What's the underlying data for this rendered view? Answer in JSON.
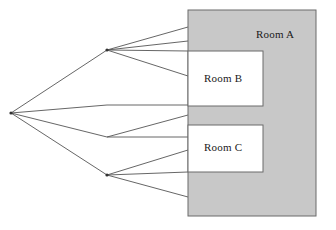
{
  "diagram": {
    "type": "nested-room-visibility-diagram",
    "canvas": {
      "width": 336,
      "height": 230,
      "background": "#ffffff"
    },
    "colors": {
      "room_a_fill": "#c8c8c8",
      "room_b_fill": "#ffffff",
      "room_c_fill": "#ffffff",
      "stroke": "#6b6b6b",
      "line": "#555555",
      "text": "#1a1a1a"
    },
    "rooms": [
      {
        "id": "room-a",
        "label": "Room A",
        "fill": "#c8c8c8",
        "x": 188,
        "y": 10,
        "width": 128,
        "height": 206,
        "label_x": 256,
        "label_y": 28
      },
      {
        "id": "room-b",
        "label": "Room B",
        "fill": "#ffffff",
        "x": 188,
        "y": 51,
        "width": 75,
        "height": 55,
        "label_x": 204,
        "label_y": 72
      },
      {
        "id": "room-c",
        "label": "Room C",
        "fill": "#ffffff",
        "x": 188,
        "y": 125,
        "width": 75,
        "height": 47,
        "label_x": 204,
        "label_y": 141
      }
    ],
    "vertices": [
      {
        "id": "eye-point",
        "x": 11,
        "y": 113
      },
      {
        "id": "upper-portal",
        "x": 107,
        "y": 50
      },
      {
        "id": "middle-portal",
        "x": 107,
        "y": 137
      },
      {
        "id": "lower-portal",
        "x": 107,
        "y": 175
      }
    ],
    "rays": [
      {
        "from": "eye-point",
        "x1": 11,
        "y1": 113,
        "x2": 107,
        "y2": 50
      },
      {
        "from": "eye-point",
        "x1": 11,
        "y1": 113,
        "x2": 107,
        "y2": 105
      },
      {
        "from": "eye-point",
        "x1": 11,
        "y1": 113,
        "x2": 107,
        "y2": 137
      },
      {
        "from": "eye-point",
        "x1": 11,
        "y1": 113,
        "x2": 107,
        "y2": 175
      },
      {
        "from": "upper-portal",
        "x1": 107,
        "y1": 50,
        "x2": 188,
        "y2": 27
      },
      {
        "from": "upper-portal",
        "x1": 107,
        "y1": 50,
        "x2": 188,
        "y2": 41
      },
      {
        "from": "upper-portal",
        "x1": 107,
        "y1": 50,
        "x2": 188,
        "y2": 51
      },
      {
        "from": "upper-portal",
        "x1": 107,
        "y1": 50,
        "x2": 188,
        "y2": 76
      },
      {
        "from": "middle-portal",
        "x1": 107,
        "y1": 105,
        "x2": 188,
        "y2": 105
      },
      {
        "from": "middle-portal",
        "x1": 107,
        "y1": 137,
        "x2": 188,
        "y2": 115
      },
      {
        "from": "middle-portal",
        "x1": 107,
        "y1": 137,
        "x2": 188,
        "y2": 137
      },
      {
        "from": "lower-portal",
        "x1": 107,
        "y1": 175,
        "x2": 188,
        "y2": 150
      },
      {
        "from": "lower-portal",
        "x1": 107,
        "y1": 175,
        "x2": 188,
        "y2": 172
      },
      {
        "from": "lower-portal",
        "x1": 107,
        "y1": 175,
        "x2": 188,
        "y2": 197
      }
    ]
  }
}
